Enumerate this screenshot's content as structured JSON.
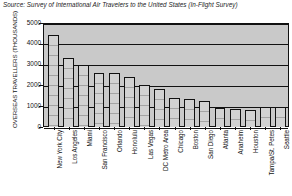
{
  "source_note": "Source: Survey of International Air Travelers to the United States (In-Flight Survey)",
  "chart_data": {
    "type": "bar",
    "title": "",
    "subtitle": "",
    "xlabel": "",
    "ylabel": "OVERSEAS TRAVELLERS (THOUSANDS)",
    "ylim": [
      0,
      5000
    ],
    "yticks": [
      5000,
      4000,
      3000,
      2000,
      1000,
      0
    ],
    "ytick_labels": [
      "5000",
      "4000",
      "3000",
      "2000",
      "1000",
      "0"
    ],
    "grid": true,
    "grid_axis": "y",
    "legend": false,
    "legend_position": "none",
    "bar_color": "#d2d2d2",
    "plot_background": "#c9c9c9",
    "axis_color": "#111111",
    "categories": [
      "New York City",
      "Los Angeles",
      "Miami",
      "San Francisco",
      "Orlando",
      "Honolulu",
      "Las Vegas",
      "DC Metro Area",
      "Chicago",
      "Boston",
      "San Diego",
      "Atlanta",
      "Anaheim",
      "Houston",
      "Tampa/St. Petes",
      "Seattle"
    ],
    "values": [
      4400,
      3300,
      3000,
      2600,
      2600,
      2400,
      2000,
      1850,
      1400,
      1350,
      1250,
      900,
      880,
      800,
      950,
      950
    ]
  }
}
